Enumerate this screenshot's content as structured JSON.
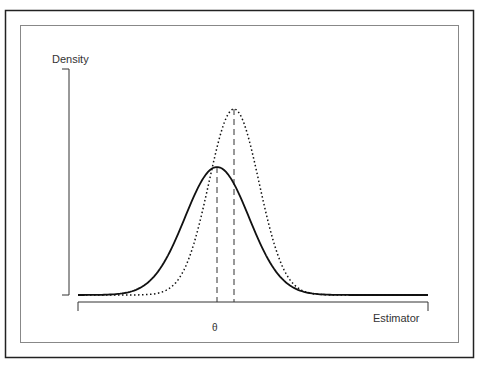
{
  "chart_data": {
    "type": "line",
    "title": "",
    "xlabel": "Estimator",
    "ylabel": "Density",
    "x_tick_labels": [
      "θ"
    ],
    "grid": false,
    "legend": null,
    "series": [
      {
        "name": "solid-curve",
        "style": "solid",
        "peak_x": 217,
        "sd_px": 32,
        "peak_height_px": 128
      },
      {
        "name": "dotted-curve",
        "style": "dotted",
        "peak_x": 234,
        "sd_px": 25,
        "peak_height_px": 186
      }
    ],
    "annotations": [
      {
        "type": "dashed-vline",
        "x": 217,
        "label": "θ (true value, mean of solid curve)"
      },
      {
        "type": "dashed-vline",
        "x": 234,
        "label": "mean of dotted curve"
      }
    ]
  },
  "labels": {
    "y": "Density",
    "x": "Estimator",
    "theta": "θ"
  }
}
